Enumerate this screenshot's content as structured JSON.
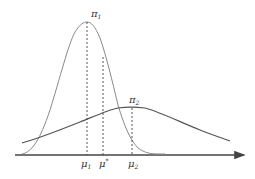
{
  "diagram": {
    "type": "two-gaussian-densities",
    "curves": [
      {
        "name": "pi1",
        "label": "π",
        "subscript": "1",
        "description": "narrow tall density",
        "color": "#8a8a8a"
      },
      {
        "name": "pi2",
        "label": "π",
        "subscript": "2",
        "description": "wide flat density",
        "color": "#555555"
      }
    ],
    "axis": {
      "color": "#444444"
    },
    "markers": [
      {
        "name": "mu1",
        "label": "μ",
        "subscript": "1"
      },
      {
        "name": "mu-star",
        "label": "μ",
        "superscript": "*"
      },
      {
        "name": "mu2",
        "label": "μ",
        "subscript": "2"
      }
    ]
  }
}
